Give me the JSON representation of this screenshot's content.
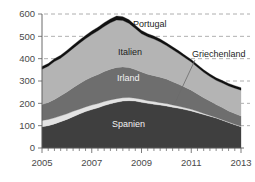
{
  "chart_data": {
    "type": "area",
    "stacked": true,
    "title": "",
    "subtitle": "",
    "xlabel": "",
    "ylabel": "",
    "xlim": [
      2005.0,
      2013.0
    ],
    "ylim": [
      0,
      600
    ],
    "grid": true,
    "grid_style": "dashed horizontal",
    "legend_position": "inline-annotations",
    "y_ticks": [
      0,
      100,
      200,
      300,
      400,
      500,
      600
    ],
    "y_tick_labels": [
      "0",
      "100",
      "200",
      "300",
      "400",
      "500",
      "600"
    ],
    "x_ticks": [
      2005,
      2007,
      2009,
      2011,
      2013
    ],
    "x_tick_labels": [
      "2005",
      "2007",
      "2009",
      "2011",
      "2013"
    ],
    "x_minor_tick_interval": 0.25,
    "x": [
      2005.0,
      2005.25,
      2005.5,
      2005.75,
      2006.0,
      2006.25,
      2006.5,
      2006.75,
      2007.0,
      2007.25,
      2007.5,
      2007.75,
      2008.0,
      2008.25,
      2008.5,
      2008.75,
      2009.0,
      2009.25,
      2009.5,
      2009.75,
      2010.0,
      2010.25,
      2010.5,
      2010.75,
      2011.0,
      2011.25,
      2011.5,
      2011.75,
      2012.0,
      2012.25,
      2012.5,
      2012.75,
      2013.0
    ],
    "series": [
      {
        "name": "Spanien",
        "color": "#3f3f3f",
        "label_color": "#eeeeee",
        "values": [
          95,
          100,
          108,
          118,
          128,
          140,
          152,
          163,
          172,
          180,
          190,
          198,
          205,
          210,
          212,
          210,
          205,
          200,
          196,
          192,
          188,
          183,
          178,
          172,
          166,
          158,
          150,
          142,
          134,
          124,
          114,
          104,
          95
        ]
      },
      {
        "name": "Griechenland",
        "color": "#e3e3e3",
        "label_color": "#1d1d1d",
        "values": [
          28,
          28,
          27,
          26,
          25,
          24,
          22,
          21,
          20,
          19,
          18,
          17,
          16,
          15,
          14,
          13,
          13,
          12,
          12,
          11,
          11,
          10,
          9,
          8,
          7,
          6,
          5,
          4,
          3,
          3,
          2,
          2,
          2
        ]
      },
      {
        "name": "Irland",
        "color": "#6e6e6e",
        "label_color": "#f2f2f2",
        "values": [
          72,
          76,
          82,
          90,
          98,
          106,
          114,
          120,
          126,
          130,
          134,
          138,
          140,
          138,
          134,
          128,
          122,
          118,
          116,
          114,
          110,
          104,
          98,
          92,
          86,
          78,
          70,
          64,
          58,
          54,
          50,
          48,
          46
        ]
      },
      {
        "name": "Italien",
        "color": "#b4b4b4",
        "label_color": "#1d1d1d",
        "values": [
          158,
          162,
          170,
          168,
          172,
          176,
          180,
          185,
          190,
          196,
          202,
          208,
          212,
          208,
          198,
          184,
          172,
          168,
          164,
          158,
          150,
          144,
          138,
          132,
          126,
          120,
          114,
          110,
          108,
          110,
          112,
          114,
          116
        ]
      },
      {
        "name": "Portugal",
        "color": "#111111",
        "label_color": "#1d1d1d",
        "values": [
          12,
          12,
          13,
          13,
          14,
          14,
          15,
          15,
          16,
          16,
          17,
          17,
          18,
          17,
          16,
          15,
          14,
          14,
          13,
          13,
          12,
          12,
          12,
          11,
          11,
          11,
          11,
          11,
          11,
          11,
          11,
          11,
          11
        ]
      }
    ],
    "totals": [
      365,
      378,
      400,
      415,
      437,
      460,
      483,
      504,
      524,
      541,
      561,
      578,
      591,
      588,
      574,
      550,
      526,
      512,
      501,
      488,
      471,
      453,
      435,
      415,
      396,
      373,
      350,
      331,
      314,
      302,
      289,
      279,
      270
    ],
    "annotations": [
      {
        "text": "Portugal",
        "x_px": 133,
        "y_px": 27,
        "anchor": "start",
        "style": "outside"
      },
      {
        "text": "Italien",
        "x_px": 118,
        "y_px": 55,
        "anchor": "start",
        "style": "on-light"
      },
      {
        "text": "Irland",
        "x_px": 117,
        "y_px": 81,
        "anchor": "start",
        "style": "on-dark"
      },
      {
        "text": "Spanien",
        "x_px": 112,
        "y_px": 127,
        "anchor": "start",
        "style": "on-dark"
      },
      {
        "text": "Griechenland",
        "x_px": 192,
        "y_px": 57,
        "anchor": "start",
        "style": "outside"
      }
    ],
    "leader_line": {
      "x1_px": 195,
      "y1_px": 60,
      "x2_px": 174,
      "y2_px": 105
    }
  },
  "axes": {
    "plot_left_px": 42,
    "plot_right_px": 241,
    "plot_top_px": 14,
    "plot_bottom_px": 148,
    "px_per_100_units": 22
  }
}
